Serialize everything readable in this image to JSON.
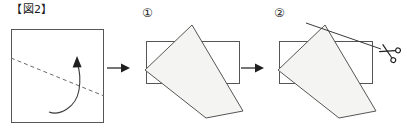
{
  "figure": {
    "title": "【図2】",
    "panel_count": 3
  },
  "panels": [
    {
      "id": "panel-initial",
      "label": "",
      "icons": [
        "square-sheet",
        "dashed-fold-line",
        "curved-fold-arrow"
      ],
      "shape": "square-sheet-with-diagonal-fold-line"
    },
    {
      "id": "panel-step-1",
      "label": "①",
      "icons": [
        "folded-paper-shape",
        "rectangle-outline"
      ],
      "shape": "rotated-quadrilateral-over-rectangle"
    },
    {
      "id": "panel-step-2",
      "label": "②",
      "icons": [
        "folded-paper-shape",
        "rectangle-outline",
        "cut-line",
        "scissors-icon"
      ],
      "shape": "rotated-quadrilateral-with-cut-line"
    }
  ],
  "arrows": [
    {
      "id": "arrow-1",
      "direction": "right"
    },
    {
      "id": "arrow-2",
      "direction": "right"
    }
  ],
  "colors": {
    "stroke": "#555555",
    "paper_fill": "#f4f4f2",
    "line": "#6b6b6b",
    "text": "#1a1a1a",
    "background": "#ffffff"
  }
}
